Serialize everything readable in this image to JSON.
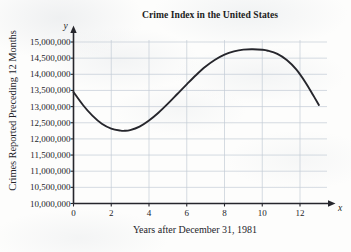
{
  "chart_data": {
    "type": "line",
    "title": "Crime Index in the United States",
    "xlabel": "Years after December 31, 1981",
    "ylabel": "Crimes Reported Preceding 12 Months",
    "x_axis_variable": "x",
    "y_axis_variable": "y",
    "grid": true,
    "legend": "none",
    "xlim": [
      0,
      13
    ],
    "ylim": [
      10000000,
      15000000
    ],
    "xticks": [
      0,
      2,
      4,
      6,
      8,
      10,
      12
    ],
    "xtick_labels": [
      "0",
      "2",
      "4",
      "6",
      "8",
      "10",
      "12"
    ],
    "yticks": [
      10000000,
      10500000,
      11000000,
      11500000,
      12000000,
      12500000,
      13000000,
      13500000,
      14000000,
      14500000,
      15000000
    ],
    "ytick_labels": [
      "10,000,000",
      "10,500,000",
      "11,000,000",
      "11,500,000",
      "12,000,000",
      "12,500,000",
      "13,000,000",
      "13,500,000",
      "14,000,000",
      "14,500,000",
      "15,000,000"
    ],
    "series": [
      {
        "name": "Crime index",
        "color": "#26262c",
        "x": [
          0,
          0.5,
          1,
          1.5,
          2,
          2.5,
          2.7,
          3,
          3.5,
          4,
          4.5,
          5,
          5.5,
          6,
          6.5,
          7,
          7.5,
          8,
          8.5,
          9,
          9.5,
          10,
          10.3,
          10.8,
          11.3,
          11.8,
          12.3,
          12.7,
          13
        ],
        "y": [
          13450000,
          13050000,
          12720000,
          12470000,
          12320000,
          12255000,
          12250000,
          12270000,
          12380000,
          12570000,
          12810000,
          13090000,
          13390000,
          13690000,
          13980000,
          14240000,
          14450000,
          14610000,
          14710000,
          14765000,
          14775000,
          14760000,
          14730000,
          14630000,
          14440000,
          14150000,
          13740000,
          13350000,
          13050000
        ]
      }
    ],
    "annotations": {
      "start_value": 13450000,
      "local_minimum": {
        "x": 2.7,
        "y": 12250000
      },
      "local_maximum": {
        "x": 9.6,
        "y": 14775000
      },
      "end_value": 13050000
    }
  }
}
